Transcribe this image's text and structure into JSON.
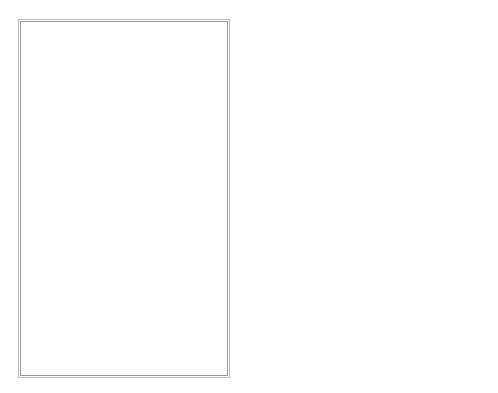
{
  "map": {
    "labels": {
      "usa": "USA",
      "el_paso": "El Paso",
      "gulf": "Gulf of Mexico",
      "pacific": "Pacific Ocean",
      "mexico": "MEXICO",
      "mesa_central": "Mesa Central"
    },
    "graticule": {
      "lat_30": "30 n",
      "lat_20": "20 n",
      "lon_110": "110 w",
      "lon_100": "100 w"
    },
    "scale_bar": {
      "unit": "Km",
      "ticks": [
        "0",
        "200",
        "400"
      ]
    },
    "colors": {
      "line": "#222222",
      "frame": "#999999",
      "background": "#ffffff"
    }
  }
}
